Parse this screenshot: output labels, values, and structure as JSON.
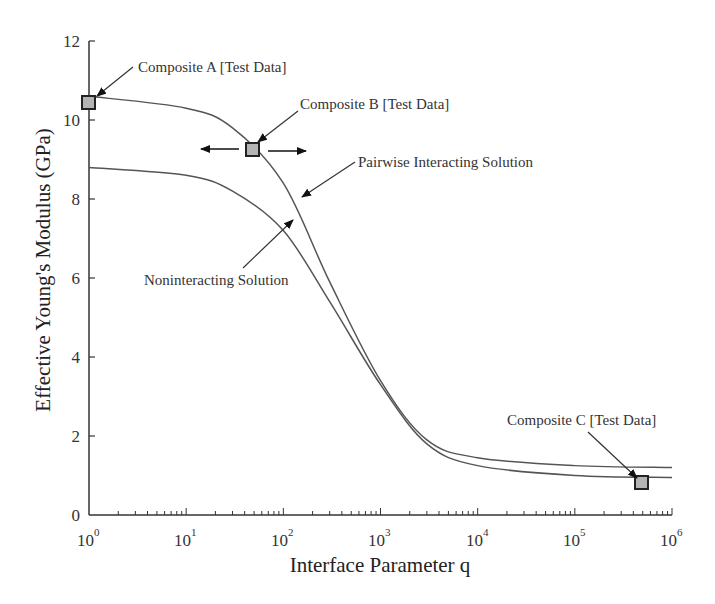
{
  "chart_data": {
    "type": "line",
    "title": "",
    "xlabel": "Interface Parameter q",
    "ylabel": "Effective Young's Modulus (GPa)",
    "x_scale": "log",
    "xlim": [
      1,
      1000000
    ],
    "ylim": [
      0,
      12
    ],
    "x_ticks": [
      "10^0",
      "10^1",
      "10^2",
      "10^3",
      "10^4",
      "10^5",
      "10^6"
    ],
    "y_ticks": [
      "0",
      "2",
      "4",
      "6",
      "8",
      "10",
      "12"
    ],
    "grid": false,
    "legend": "none (inline annotations)",
    "series": [
      {
        "name": "Pairwise Interacting Solution",
        "x": [
          1,
          10,
          30,
          100,
          300,
          1000,
          3000,
          10000,
          100000,
          1000000
        ],
        "values": [
          10.6,
          10.3,
          9.8,
          8.4,
          5.9,
          3.4,
          1.9,
          1.45,
          1.25,
          1.2
        ]
      },
      {
        "name": "Noninteracting Solution",
        "x": [
          1,
          10,
          30,
          100,
          300,
          1000,
          3000,
          10000,
          100000,
          1000000
        ],
        "values": [
          8.8,
          8.6,
          8.2,
          7.2,
          5.4,
          3.3,
          1.8,
          1.25,
          1.0,
          0.95
        ]
      }
    ],
    "test_points": [
      {
        "name": "Composite A [Test Data]",
        "x": 1,
        "y": 10.4
      },
      {
        "name": "Composite B [Test Data]",
        "x": 50,
        "y": 9.25,
        "note": "horizontal double arrow indicating uncertainty in q"
      },
      {
        "name": "Composite C [Test Data]",
        "x": 500000,
        "y": 0.8
      }
    ],
    "annotations": [
      "Composite A [Test Data]",
      "Composite B [Test Data]",
      "Composite C [Test Data]",
      "Pairwise Interacting Solution",
      "Noninteracting Solution"
    ]
  },
  "labels": {
    "xlabel": "Interface Parameter q",
    "ylabel": "Effective Young's Modulus (GPa)",
    "y_ticks": [
      "0",
      "2",
      "4",
      "6",
      "8",
      "10",
      "12"
    ],
    "x_tick_base": "10",
    "x_tick_exps": [
      "0",
      "1",
      "2",
      "3",
      "4",
      "5",
      "6"
    ],
    "composite_a": "Composite A [Test Data]",
    "composite_b": "Composite B [Test Data]",
    "composite_c": "Composite C [Test Data]",
    "pairwise": "Pairwise Interacting Solution",
    "noninteracting": "Noninteracting Solution"
  },
  "colors": {
    "curve": "#555555",
    "marker_fill": "#b4b4b4",
    "marker_stroke": "#222222",
    "axis": "#333333"
  }
}
